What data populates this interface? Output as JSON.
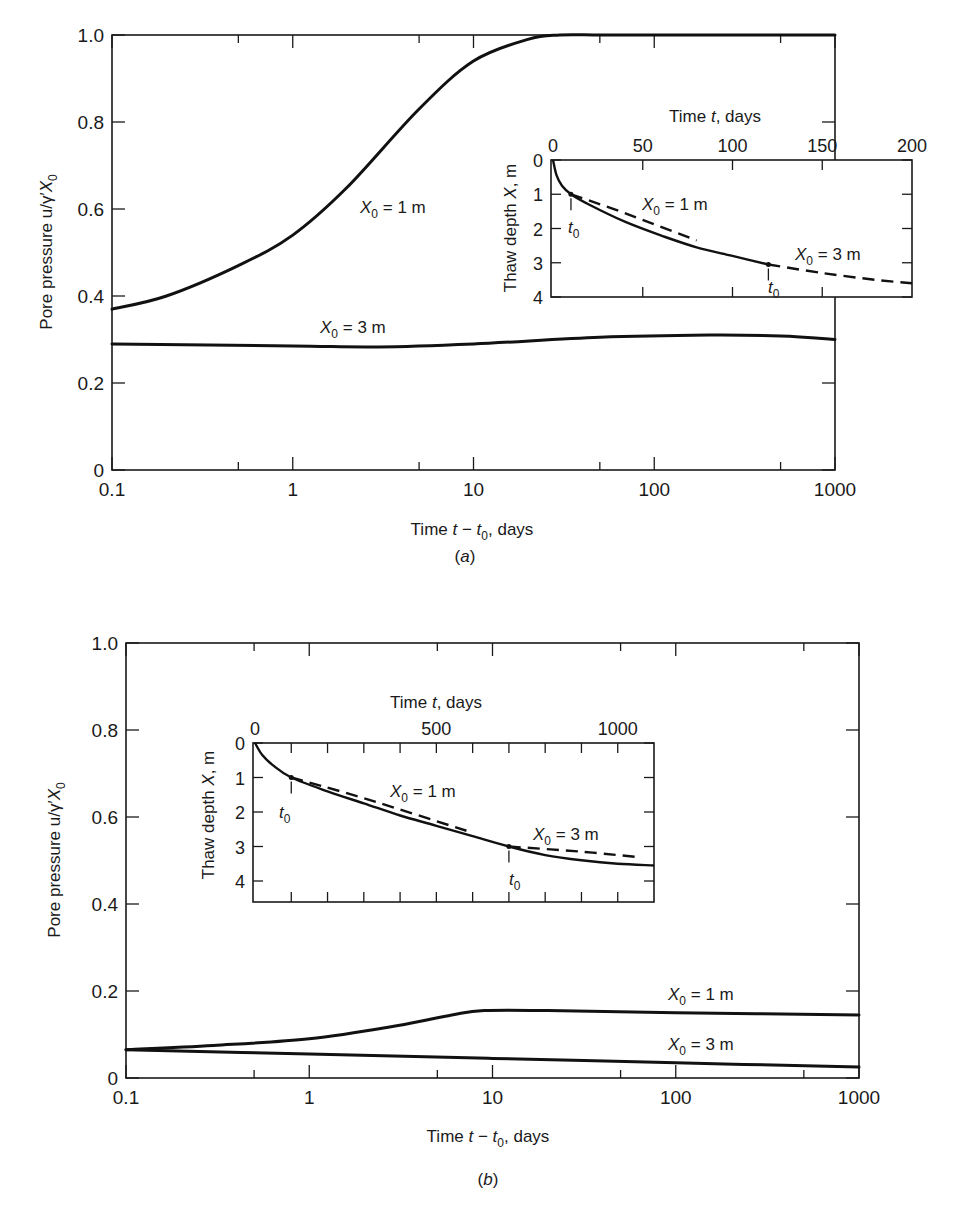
{
  "page": {
    "header_fragment": ""
  },
  "chart_data": [
    {
      "id": "a",
      "panel_label": "(a)",
      "type": "line",
      "title": "",
      "xlabel": "Time t − t0, days",
      "ylabel": "Pore pressure u/γ′X0",
      "xscale": "log",
      "xlim": [
        0.1,
        1000
      ],
      "ylim": [
        0,
        1.0
      ],
      "xticks": [
        "0.1",
        "1",
        "10",
        "100",
        "1000"
      ],
      "yticks": [
        "0",
        "0.2",
        "0.4",
        "0.6",
        "0.8",
        "1.0"
      ],
      "grid": false,
      "series": [
        {
          "name": "X0 = 1 m",
          "x": [
            0.1,
            0.2,
            0.5,
            1,
            2,
            5,
            10,
            20,
            30,
            50,
            100,
            1000
          ],
          "y": [
            0.37,
            0.4,
            0.47,
            0.54,
            0.65,
            0.83,
            0.94,
            0.99,
            1.0,
            1.0,
            1.0,
            1.0
          ]
        },
        {
          "name": "X0 = 3 m",
          "x": [
            0.1,
            1,
            3,
            10,
            50,
            200,
            500,
            1000
          ],
          "y": [
            0.29,
            0.285,
            0.283,
            0.29,
            0.305,
            0.31,
            0.308,
            0.3
          ]
        }
      ],
      "annotations": [
        {
          "text": "X0 = 1 m",
          "near": "upper curve, x≈5"
        },
        {
          "text": "X0 = 3 m",
          "near": "lower curve, x≈1"
        }
      ],
      "inset": {
        "type": "line",
        "xlabel": "Time t, days",
        "ylabel": "Thaw depth X, m",
        "xlim": [
          0,
          200
        ],
        "ylim": [
          0,
          4
        ],
        "y_inverted": true,
        "xticks": [
          "0",
          "50",
          "100",
          "150",
          "200"
        ],
        "yticks": [
          "0",
          "1",
          "2",
          "3",
          "4"
        ],
        "series": [
          {
            "name": "thaw front (solid)",
            "style": "solid",
            "x": [
              0,
              2,
              5,
              10,
              20,
              40,
              60,
              80,
              100,
              120
            ],
            "y": [
              0,
              0.45,
              0.75,
              1.0,
              1.3,
              1.8,
              2.2,
              2.55,
              2.8,
              3.05
            ]
          },
          {
            "name": "X0 = 1 m",
            "style": "dashed",
            "x": [
              10,
              40,
              80
            ],
            "y": [
              1.0,
              1.55,
              2.35
            ]
          },
          {
            "name": "X0 = 3 m",
            "style": "dashed",
            "x": [
              120,
              150,
              180,
              200
            ],
            "y": [
              3.05,
              3.3,
              3.5,
              3.6
            ]
          }
        ],
        "annotations": [
          {
            "text": "X0 = 1 m"
          },
          {
            "text": "X0 = 3 m"
          },
          {
            "text": "t0",
            "at_x": 10
          },
          {
            "text": "t0",
            "at_x": 120
          }
        ]
      }
    },
    {
      "id": "b",
      "panel_label": "(b)",
      "type": "line",
      "title": "",
      "xlabel": "Time t − t0, days",
      "ylabel": "Pore pressure u/γ′X0",
      "xscale": "log",
      "xlim": [
        0.1,
        1000
      ],
      "ylim": [
        0,
        1.0
      ],
      "xticks": [
        "0.1",
        "1",
        "10",
        "100",
        "1000"
      ],
      "yticks": [
        "0",
        "0.2",
        "0.4",
        "0.6",
        "0.8",
        "1.0"
      ],
      "grid": false,
      "series": [
        {
          "name": "X0 = 1 m",
          "x": [
            0.1,
            0.3,
            1,
            3,
            6,
            9,
            20,
            100,
            1000
          ],
          "y": [
            0.065,
            0.075,
            0.09,
            0.12,
            0.145,
            0.155,
            0.155,
            0.15,
            0.145
          ]
        },
        {
          "name": "X0 = 3 m",
          "x": [
            0.1,
            1,
            10,
            100,
            1000
          ],
          "y": [
            0.065,
            0.055,
            0.045,
            0.035,
            0.025
          ]
        }
      ],
      "annotations": [
        {
          "text": "X0 = 1 m",
          "near": "upper curve, x≈100"
        },
        {
          "text": "X0 = 3 m",
          "near": "lower curve, x≈100"
        }
      ],
      "inset": {
        "type": "line",
        "xlabel": "Time t, days",
        "ylabel": "Thaw depth X, m",
        "xlim": [
          0,
          1100
        ],
        "ylim": [
          0,
          4.5
        ],
        "y_inverted": true,
        "xticks": [
          "0",
          "500",
          "1000"
        ],
        "yticks": [
          "0",
          "1",
          "2",
          "3",
          "4"
        ],
        "series": [
          {
            "name": "thaw front (solid)",
            "style": "solid",
            "x": [
              0,
              20,
              50,
              100,
              200,
              300,
              400,
              500,
              600,
              700,
              800,
              900,
              1000,
              1100
            ],
            "y": [
              0,
              0.35,
              0.65,
              1.0,
              1.4,
              1.75,
              2.1,
              2.4,
              2.7,
              3.0,
              3.25,
              3.4,
              3.5,
              3.55
            ]
          },
          {
            "name": "X0 = 1 m",
            "style": "dashed",
            "x": [
              100,
              300,
              600
            ],
            "y": [
              1.0,
              1.6,
              2.6
            ]
          },
          {
            "name": "X0 = 3 m",
            "style": "dashed",
            "x": [
              700,
              900,
              1050
            ],
            "y": [
              3.0,
              3.15,
              3.3
            ]
          }
        ],
        "annotations": [
          {
            "text": "X0 = 1 m"
          },
          {
            "text": "X0 = 3 m"
          },
          {
            "text": "t0",
            "at_x": 100
          },
          {
            "text": "t0",
            "at_x": 700
          }
        ]
      }
    }
  ],
  "labels": {
    "a": {
      "yaxis_main": "Pore pressure u/γ′",
      "yaxis_sym": "X",
      "yaxis_sub": "0",
      "xaxis_pre": "Time ",
      "xaxis_t": "t",
      "xaxis_minus": " − ",
      "xaxis_t0": "t",
      "xaxis_sub": "0",
      "xaxis_post": ", days",
      "panel": "a",
      "curve1_sym": "X",
      "curve1_sub": "0",
      "curve1_txt": " = 1 m",
      "curve2_sym": "X",
      "curve2_sub": "0",
      "curve2_txt": " = 3 m",
      "inset_time_pre": "Time ",
      "inset_time_t": "t",
      "inset_time_post": ", days",
      "inset_depth_pre": "Thaw depth ",
      "inset_depth_sym": "X",
      "inset_depth_post": ", m",
      "t0_sym": "t",
      "t0_sub": "0"
    },
    "b": {
      "yaxis_main": "Pore pressure u/γ′",
      "yaxis_sym": "X",
      "yaxis_sub": "0",
      "xaxis_pre": "Time ",
      "xaxis_t": "t",
      "xaxis_minus": " − ",
      "xaxis_t0": "t",
      "xaxis_sub": "0",
      "xaxis_post": ", days",
      "panel": "b",
      "curve1_sym": "X",
      "curve1_sub": "0",
      "curve1_txt": " = 1 m",
      "curve2_sym": "X",
      "curve2_sub": "0",
      "curve2_txt": " = 3 m",
      "inset_time_pre": "Time ",
      "inset_time_t": "t",
      "inset_time_post": ", days",
      "inset_depth_pre": "Thaw depth ",
      "inset_depth_sym": "X",
      "inset_depth_post": ", m",
      "t0_sym": "t",
      "t0_sub": "0"
    }
  }
}
